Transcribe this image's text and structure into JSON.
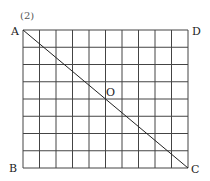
{
  "problem_number": "(2)",
  "grid": {
    "columns": 10,
    "rows": 8
  },
  "points": {
    "A": "A",
    "B": "B",
    "C": "C",
    "D": "D",
    "O": "O"
  },
  "segments": [
    {
      "from": "A",
      "to": "C"
    }
  ]
}
